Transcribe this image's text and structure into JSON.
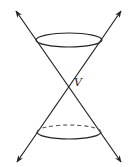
{
  "figure": {
    "vertex_label": "V",
    "colors": {
      "stroke": "#222222",
      "background": "#ffffff"
    },
    "elements": {
      "generating_lines": 2,
      "upper_nappe_circle": "solid ellipse",
      "lower_nappe_circle": "ellipse with dashed back edge",
      "arrows": 4
    }
  }
}
